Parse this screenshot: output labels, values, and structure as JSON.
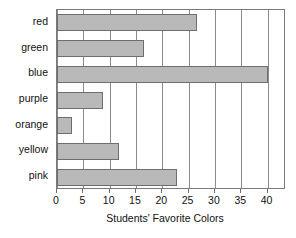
{
  "chart_data": {
    "type": "bar",
    "orientation": "horizontal",
    "title": "",
    "xlabel": "Students' Favorite Colors",
    "ylabel": "",
    "categories": [
      "red",
      "green",
      "blue",
      "purple",
      "orange",
      "yellow",
      "pink"
    ],
    "values": [
      26.5,
      16.5,
      40,
      8.7,
      2.9,
      11.8,
      22.8
    ],
    "xlim": [
      0,
      43.5
    ],
    "xticks": [
      0,
      5,
      10,
      15,
      20,
      25,
      30,
      35,
      40
    ],
    "xtick_labels": [
      "0",
      "5",
      "10",
      "15",
      "20",
      "25",
      "30",
      "35",
      "40"
    ],
    "grid": "vertical",
    "legend": "none",
    "bar_fill_color": "#b9b9b9",
    "bar_border_color": "#6e6e6e",
    "gridline_color": "#8a8a8a",
    "plot_border_color": "#7a7a7a",
    "background_color": "#ffffff"
  }
}
